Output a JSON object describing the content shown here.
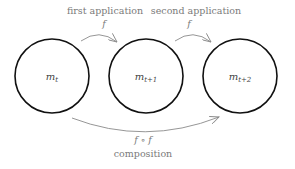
{
  "nodes": [
    {
      "id": "m_t",
      "base": "m",
      "sub": "t"
    },
    {
      "id": "m_t+1",
      "base": "m",
      "sub": "t+1"
    },
    {
      "id": "m_t+2",
      "base": "m",
      "sub": "t+2"
    }
  ],
  "edges": [
    {
      "from": "m_t",
      "to": "m_t+1",
      "caption": "first application",
      "symbol": "f"
    },
    {
      "from": "m_t+1",
      "to": "m_t+2",
      "caption": "second application",
      "symbol": "f"
    },
    {
      "from": "m_t",
      "to": "m_t+2",
      "caption": "composition",
      "symbol": "f ∘ f"
    }
  ],
  "colors": {
    "node_stroke": "#111111",
    "arrow": "#8a8a8a",
    "text": "#7a7a7a"
  }
}
